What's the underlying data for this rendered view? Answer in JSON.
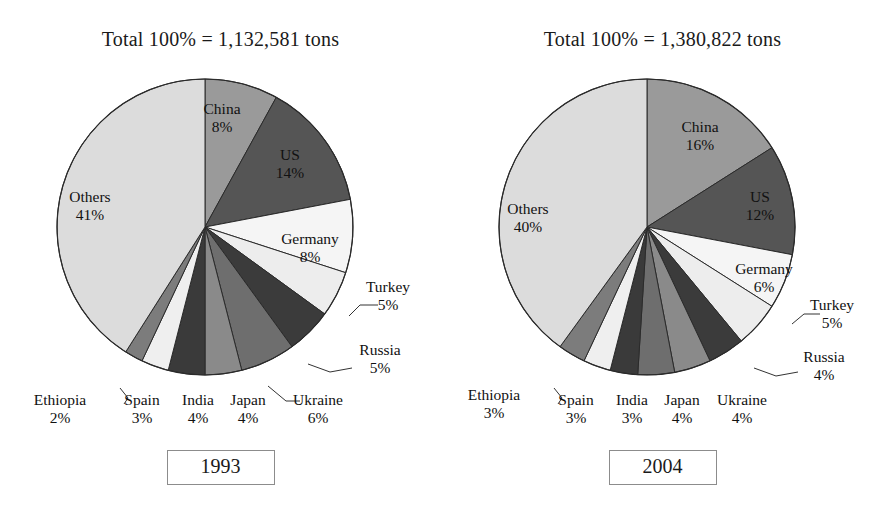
{
  "figure": {
    "background": "#ffffff",
    "text_color": "#1a1a1a",
    "border_color": "#8c8c8c"
  },
  "panels": [
    {
      "id": "left",
      "title": "Total 100% = 1,132,581 tons",
      "year_label": "1993",
      "center": {
        "x": 205,
        "y": 175
      },
      "radius": 148,
      "chart_data": {
        "type": "pie",
        "title": "Total 100% = 1,132,581 tons",
        "total_label": "Total 100% = 1,132,581 tons",
        "total_tons": 1132581,
        "year": "1993",
        "start_angle_deg": 0,
        "direction": "clockwise",
        "legend": "none",
        "labels": [
          "China",
          "US",
          "Germany",
          "Turkey",
          "Russia",
          "Ukraine",
          "Japan",
          "India",
          "Spain",
          "Ethiopia",
          "Others"
        ],
        "values": [
          8,
          14,
          8,
          5,
          5,
          6,
          4,
          4,
          3,
          2,
          41
        ],
        "unit": "%",
        "slices": [
          {
            "name": "China",
            "pct": 8,
            "pct_label": "8%",
            "color": "#9a9a9a",
            "label_pos": "inside",
            "label_x": 222,
            "label_y": 62,
            "anchor": "middle"
          },
          {
            "name": "US",
            "pct": 14,
            "pct_label": "14%",
            "color": "#555555",
            "label_pos": "inside",
            "label_x": 290,
            "label_y": 108,
            "anchor": "middle",
            "label_fill": "#111111"
          },
          {
            "name": "Germany",
            "pct": 8,
            "pct_label": "8%",
            "color": "#f5f5f5",
            "label_pos": "inside",
            "label_x": 310,
            "label_y": 192,
            "anchor": "middle"
          },
          {
            "name": "Turkey",
            "pct": 5,
            "pct_label": "5%",
            "color": "#ededed",
            "label_pos": "outside",
            "label_x": 388,
            "label_y": 240,
            "anchor": "middle",
            "leader": [
              [
                349,
                264
              ],
              [
                360,
                253
              ],
              [
                378,
                253
              ]
            ]
          },
          {
            "name": "Russia",
            "pct": 5,
            "pct_label": "5%",
            "color": "#3b3b3b",
            "label_pos": "outside",
            "label_x": 380,
            "label_y": 303,
            "anchor": "middle",
            "leader": [
              [
                308,
                312
              ],
              [
                330,
                320
              ],
              [
                352,
                316
              ]
            ]
          },
          {
            "name": "Ukraine",
            "pct": 6,
            "pct_label": "6%",
            "color": "#6e6e6e",
            "label_pos": "outside",
            "label_x": 318,
            "label_y": 353,
            "anchor": "middle",
            "leader": [
              [
                268,
                334
              ],
              [
                286,
                349
              ],
              [
                300,
                349
              ]
            ]
          },
          {
            "name": "Japan",
            "pct": 4,
            "pct_label": "4%",
            "color": "#8a8a8a",
            "label_pos": "below",
            "label_x": 248,
            "label_y": 353,
            "anchor": "middle"
          },
          {
            "name": "India",
            "pct": 4,
            "pct_label": "4%",
            "color": "#3a3a3a",
            "label_pos": "below",
            "label_x": 198,
            "label_y": 353,
            "anchor": "middle"
          },
          {
            "name": "Spain",
            "pct": 3,
            "pct_label": "3%",
            "color": "#efefef",
            "label_pos": "below",
            "label_x": 142,
            "label_y": 353,
            "anchor": "middle",
            "leader": [
              [
                120,
                336
              ],
              [
                128,
                346
              ],
              [
                124,
                352
              ]
            ]
          },
          {
            "name": "Ethiopia",
            "pct": 2,
            "pct_label": "2%",
            "color": "#7c7c7c",
            "label_pos": "below",
            "label_x": 60,
            "label_y": 353,
            "anchor": "middle"
          },
          {
            "name": "Others",
            "pct": 41,
            "pct_label": "41%",
            "color": "#dcdcdc",
            "label_pos": "inside",
            "label_x": 90,
            "label_y": 150,
            "anchor": "middle"
          }
        ]
      }
    },
    {
      "id": "right",
      "title": "Total 100% = 1,380,822 tons",
      "year_label": "2004",
      "center": {
        "x": 205,
        "y": 175
      },
      "radius": 148,
      "chart_data": {
        "type": "pie",
        "title": "Total 100% = 1,380,822 tons",
        "total_label": "Total 100% = 1,380,822 tons",
        "total_tons": 1380822,
        "year": "2004",
        "start_angle_deg": 0,
        "direction": "clockwise",
        "legend": "none",
        "labels": [
          "China",
          "US",
          "Germany",
          "Turkey",
          "Russia",
          "Ukraine",
          "Japan",
          "India",
          "Spain",
          "Ethiopia",
          "Others"
        ],
        "values": [
          16,
          12,
          6,
          5,
          4,
          4,
          4,
          3,
          3,
          3,
          40
        ],
        "unit": "%",
        "slices": [
          {
            "name": "China",
            "pct": 16,
            "pct_label": "16%",
            "color": "#9a9a9a",
            "label_pos": "inside",
            "label_x": 258,
            "label_y": 80,
            "anchor": "middle"
          },
          {
            "name": "US",
            "pct": 12,
            "pct_label": "12%",
            "color": "#555555",
            "label_pos": "inside",
            "label_x": 318,
            "label_y": 150,
            "anchor": "middle",
            "label_fill": "#111111"
          },
          {
            "name": "Germany",
            "pct": 6,
            "pct_label": "6%",
            "color": "#f5f5f5",
            "label_pos": "inside",
            "label_x": 322,
            "label_y": 222,
            "anchor": "middle"
          },
          {
            "name": "Turkey",
            "pct": 5,
            "pct_label": "5%",
            "color": "#ededed",
            "label_pos": "outside",
            "label_x": 390,
            "label_y": 258,
            "anchor": "middle",
            "leader": [
              [
                350,
                272
              ],
              [
                362,
                262
              ],
              [
                378,
                262
              ]
            ]
          },
          {
            "name": "Russia",
            "pct": 4,
            "pct_label": "4%",
            "color": "#3b3b3b",
            "label_pos": "outside",
            "label_x": 382,
            "label_y": 310,
            "anchor": "middle",
            "leader": [
              [
                312,
                316
              ],
              [
                334,
                324
              ],
              [
                356,
                320
              ]
            ]
          },
          {
            "name": "Ukraine",
            "pct": 4,
            "pct_label": "4%",
            "color": "#8a8a8a",
            "label_pos": "below",
            "label_x": 300,
            "label_y": 353,
            "anchor": "middle"
          },
          {
            "name": "Japan",
            "pct": 4,
            "pct_label": "4%",
            "color": "#6e6e6e",
            "label_pos": "below",
            "label_x": 240,
            "label_y": 353,
            "anchor": "middle"
          },
          {
            "name": "India",
            "pct": 3,
            "pct_label": "3%",
            "color": "#3a3a3a",
            "label_pos": "below",
            "label_x": 190,
            "label_y": 353,
            "anchor": "middle"
          },
          {
            "name": "Spain",
            "pct": 3,
            "pct_label": "3%",
            "color": "#efefef",
            "label_pos": "below",
            "label_x": 134,
            "label_y": 353,
            "anchor": "middle",
            "leader": [
              [
                112,
                336
              ],
              [
                120,
                346
              ],
              [
                116,
                352
              ]
            ]
          },
          {
            "name": "Ethiopia",
            "pct": 3,
            "pct_label": "3%",
            "color": "#7c7c7c",
            "label_pos": "below",
            "label_x": 52,
            "label_y": 348,
            "anchor": "middle"
          },
          {
            "name": "Others",
            "pct": 40,
            "pct_label": "40%",
            "color": "#dcdcdc",
            "label_pos": "inside",
            "label_x": 86,
            "label_y": 162,
            "anchor": "middle"
          }
        ]
      }
    }
  ]
}
